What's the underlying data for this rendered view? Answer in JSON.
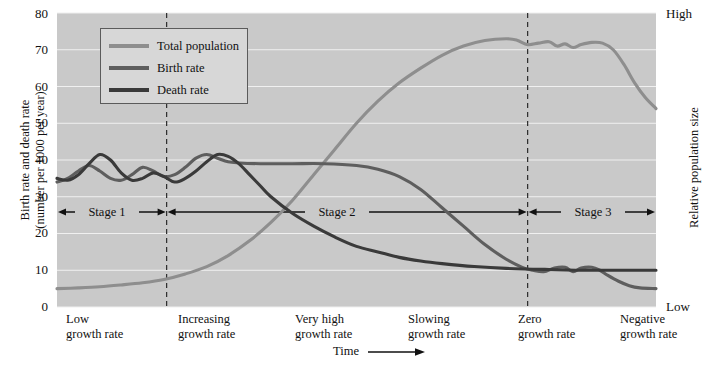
{
  "chart_data": {
    "type": "line",
    "xlabel": "Time",
    "ylabel": "Birth rate and death rate (number per 1000 per year)",
    "ylabel_right": "Relative population size",
    "ylim": [
      0,
      80
    ],
    "yticks": [
      "0",
      "10",
      "20",
      "30",
      "40",
      "50",
      "60",
      "70",
      "80"
    ],
    "right_axis_ticks": [
      "High",
      "Low"
    ],
    "grid": true,
    "legend_position": "top-left",
    "series": [
      {
        "name": "Total population",
        "color": "#8e8e8e",
        "points": [
          [
            0,
            5
          ],
          [
            4,
            5.2
          ],
          [
            8,
            5.5
          ],
          [
            12,
            6
          ],
          [
            16,
            6.6
          ],
          [
            20,
            7.5
          ],
          [
            24,
            9
          ],
          [
            28,
            11
          ],
          [
            32,
            14
          ],
          [
            36,
            18
          ],
          [
            40,
            23
          ],
          [
            44,
            29
          ],
          [
            48,
            36
          ],
          [
            52,
            43
          ],
          [
            56,
            50
          ],
          [
            60,
            56
          ],
          [
            64,
            61
          ],
          [
            68,
            65
          ],
          [
            72,
            68.5
          ],
          [
            76,
            71
          ],
          [
            80,
            72.5
          ],
          [
            84,
            73
          ],
          [
            86,
            72.6
          ],
          [
            88,
            71.4
          ],
          [
            90,
            71.8
          ],
          [
            92,
            72.2
          ],
          [
            93.5,
            71
          ],
          [
            95,
            71.6
          ],
          [
            96.5,
            70.6
          ],
          [
            98,
            71.4
          ],
          [
            100,
            72
          ],
          [
            102,
            71.8
          ],
          [
            104,
            70
          ],
          [
            106,
            66
          ],
          [
            108,
            61
          ],
          [
            110,
            57
          ],
          [
            112,
            54
          ]
        ]
      },
      {
        "name": "Birth rate",
        "color": "#5e5e5e",
        "points": [
          [
            0,
            34
          ],
          [
            2,
            35
          ],
          [
            4,
            37
          ],
          [
            6,
            38.5
          ],
          [
            8,
            37
          ],
          [
            10,
            35
          ],
          [
            12,
            34.5
          ],
          [
            14,
            36
          ],
          [
            16,
            38
          ],
          [
            18,
            37
          ],
          [
            20,
            35.5
          ],
          [
            22,
            36
          ],
          [
            24,
            38
          ],
          [
            26,
            40.5
          ],
          [
            28,
            41.5
          ],
          [
            30,
            40.5
          ],
          [
            32,
            39.5
          ],
          [
            34,
            39.2
          ],
          [
            38,
            39
          ],
          [
            44,
            39
          ],
          [
            50,
            39
          ],
          [
            56,
            38.5
          ],
          [
            60,
            37.5
          ],
          [
            64,
            35.5
          ],
          [
            68,
            32
          ],
          [
            72,
            27
          ],
          [
            76,
            22
          ],
          [
            80,
            17
          ],
          [
            84,
            13
          ],
          [
            87,
            10.8
          ],
          [
            89,
            10
          ],
          [
            91,
            9.6
          ],
          [
            93,
            10.6
          ],
          [
            95,
            10.8
          ],
          [
            96.5,
            9.6
          ],
          [
            98,
            10.6
          ],
          [
            100,
            10.8
          ],
          [
            101.5,
            10
          ],
          [
            103,
            8.6
          ],
          [
            105,
            7
          ],
          [
            107,
            5.8
          ],
          [
            109,
            5.2
          ],
          [
            112,
            5
          ]
        ]
      },
      {
        "name": "Death rate",
        "color": "#3a3a3a",
        "points": [
          [
            0,
            35
          ],
          [
            2,
            34.5
          ],
          [
            4,
            36
          ],
          [
            6,
            39
          ],
          [
            8,
            41.5
          ],
          [
            10,
            40
          ],
          [
            12,
            36.5
          ],
          [
            14,
            34.5
          ],
          [
            16,
            35
          ],
          [
            18,
            36.5
          ],
          [
            20,
            35.5
          ],
          [
            22,
            34
          ],
          [
            24,
            35
          ],
          [
            26,
            37
          ],
          [
            28,
            39.5
          ],
          [
            30,
            41.5
          ],
          [
            32,
            41
          ],
          [
            34,
            39
          ],
          [
            36,
            36
          ],
          [
            38,
            33
          ],
          [
            40,
            30
          ],
          [
            44,
            25.5
          ],
          [
            48,
            22
          ],
          [
            52,
            19
          ],
          [
            56,
            16.5
          ],
          [
            60,
            15
          ],
          [
            64,
            13.5
          ],
          [
            68,
            12.5
          ],
          [
            72,
            11.8
          ],
          [
            78,
            11
          ],
          [
            84,
            10.5
          ],
          [
            92,
            10.2
          ],
          [
            100,
            10
          ],
          [
            112,
            10
          ]
        ]
      }
    ],
    "stages": [
      {
        "label": "Stage 1",
        "start": 0,
        "end": 20.5
      },
      {
        "label": "Stage 2",
        "start": 20.5,
        "end": 88
      },
      {
        "label": "Stage 3",
        "start": 88,
        "end": 112
      }
    ],
    "dividers": [
      20.5,
      88
    ],
    "x_annotations": [
      {
        "line1": "Low",
        "line2": "growth rate"
      },
      {
        "line1": "Increasing",
        "line2": "growth rate"
      },
      {
        "line1": "Very high",
        "line2": "growth rate"
      },
      {
        "line1": "Slowing",
        "line2": "growth rate"
      },
      {
        "line1": "Zero",
        "line2": "growth rate"
      },
      {
        "line1": "Negative",
        "line2": "growth rate"
      }
    ]
  },
  "axes": {
    "y_left_title_line1": "Birth rate and death rate",
    "y_left_title_line2": "(number per 1000 per year)",
    "y_right_title": "Relative population size",
    "right_top": "High",
    "right_bottom": "Low",
    "time_label": "Time"
  },
  "colors": {
    "plot_background": "#c9c9c9",
    "gridline": "#f0f0f0",
    "total_population": "#8e8e8e",
    "birth_rate": "#5e5e5e",
    "death_rate": "#3a3a3a",
    "divider": "#2b2b2b",
    "legend_background": "#d7d7d7",
    "legend_border": "#5b5b5b"
  }
}
